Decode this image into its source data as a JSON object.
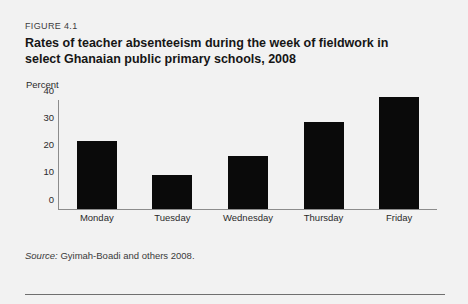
{
  "figure": {
    "number": "FIGURE 4.1",
    "title": "Rates of teacher absenteeism during the week of fieldwork in select Ghanaian public primary schools, 2008",
    "source_prefix": "Source:",
    "source_text": " Gyimah-Boadi and others 2008."
  },
  "chart_data": {
    "type": "bar",
    "title": "Rates of teacher absenteeism during the week of fieldwork in select Ghanaian public primary schools, 2008",
    "subtitle": "",
    "categories": [
      "Monday",
      "Tuesday",
      "Wednesday",
      "Thursday",
      "Friday"
    ],
    "values": [
      25,
      12.5,
      19.5,
      32,
      41
    ],
    "series": [
      {
        "name": "Teacher absenteeism rate",
        "values": [
          25,
          12.5,
          19.5,
          32,
          41
        ]
      }
    ],
    "xlabel": "",
    "ylabel": "Percent",
    "ylim": [
      0,
      40
    ],
    "yticks": [
      0,
      10,
      20,
      30,
      40
    ],
    "ytick_labels": [
      "0",
      "10",
      "20",
      "30",
      "40"
    ],
    "grid": false,
    "legend": false,
    "legend_position": "none",
    "bar_color": "#0a0a0a",
    "axis_color": "#8c8c8c",
    "background_color": "#f2f2f2"
  }
}
